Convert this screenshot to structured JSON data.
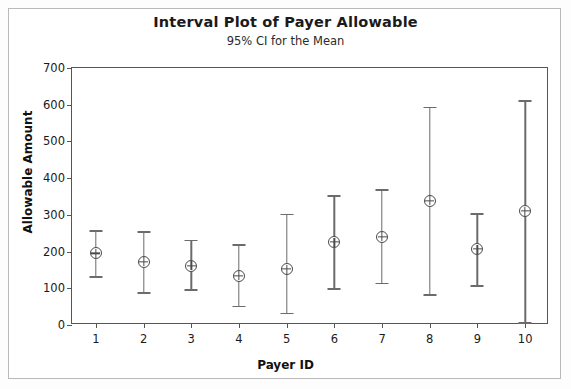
{
  "chart_data": {
    "type": "scatter",
    "title": "Interval Plot of Payer Allowable",
    "subtitle": "95% CI for the Mean",
    "xlabel": "Payer ID",
    "ylabel": "Allowable Amount",
    "ylim": [
      0,
      700
    ],
    "ytick_labels": [
      "0",
      "100",
      "200",
      "300",
      "400",
      "500",
      "600",
      "700"
    ],
    "ytick_values": [
      0,
      100,
      200,
      300,
      400,
      500,
      600,
      700
    ],
    "categories": [
      "1",
      "2",
      "3",
      "4",
      "5",
      "6",
      "7",
      "8",
      "9",
      "10"
    ],
    "grid": false,
    "legend": false,
    "series": [
      {
        "name": "Mean with 95% CI",
        "values": [
          195,
          172,
          162,
          134,
          152,
          226,
          240,
          338,
          207,
          310
        ],
        "ci_lower": [
          133,
          90,
          98,
          53,
          33,
          101,
          115,
          84,
          108,
          8
        ],
        "ci_upper": [
          258,
          255,
          232,
          220,
          303,
          353,
          370,
          595,
          305,
          612
        ]
      }
    ],
    "points": [
      {
        "x": "1",
        "mean": 195,
        "lower": 133,
        "upper": 258
      },
      {
        "x": "2",
        "mean": 172,
        "lower": 90,
        "upper": 255
      },
      {
        "x": "3",
        "mean": 162,
        "lower": 98,
        "upper": 232
      },
      {
        "x": "4",
        "mean": 134,
        "lower": 53,
        "upper": 220
      },
      {
        "x": "5",
        "mean": 152,
        "lower": 33,
        "upper": 303
      },
      {
        "x": "6",
        "mean": 226,
        "lower": 101,
        "upper": 353
      },
      {
        "x": "7",
        "mean": 240,
        "lower": 115,
        "upper": 370
      },
      {
        "x": "8",
        "mean": 338,
        "lower": 84,
        "upper": 595
      },
      {
        "x": "9",
        "mean": 207,
        "lower": 108,
        "upper": 305
      },
      {
        "x": "10",
        "mean": 310,
        "lower": 8,
        "upper": 612
      }
    ],
    "colors": {
      "marker": "#4a4a4a",
      "error_bar": "#6b6b6b",
      "axis": "#555555",
      "text": "#1a1a1a",
      "background": "#ffffff"
    }
  }
}
